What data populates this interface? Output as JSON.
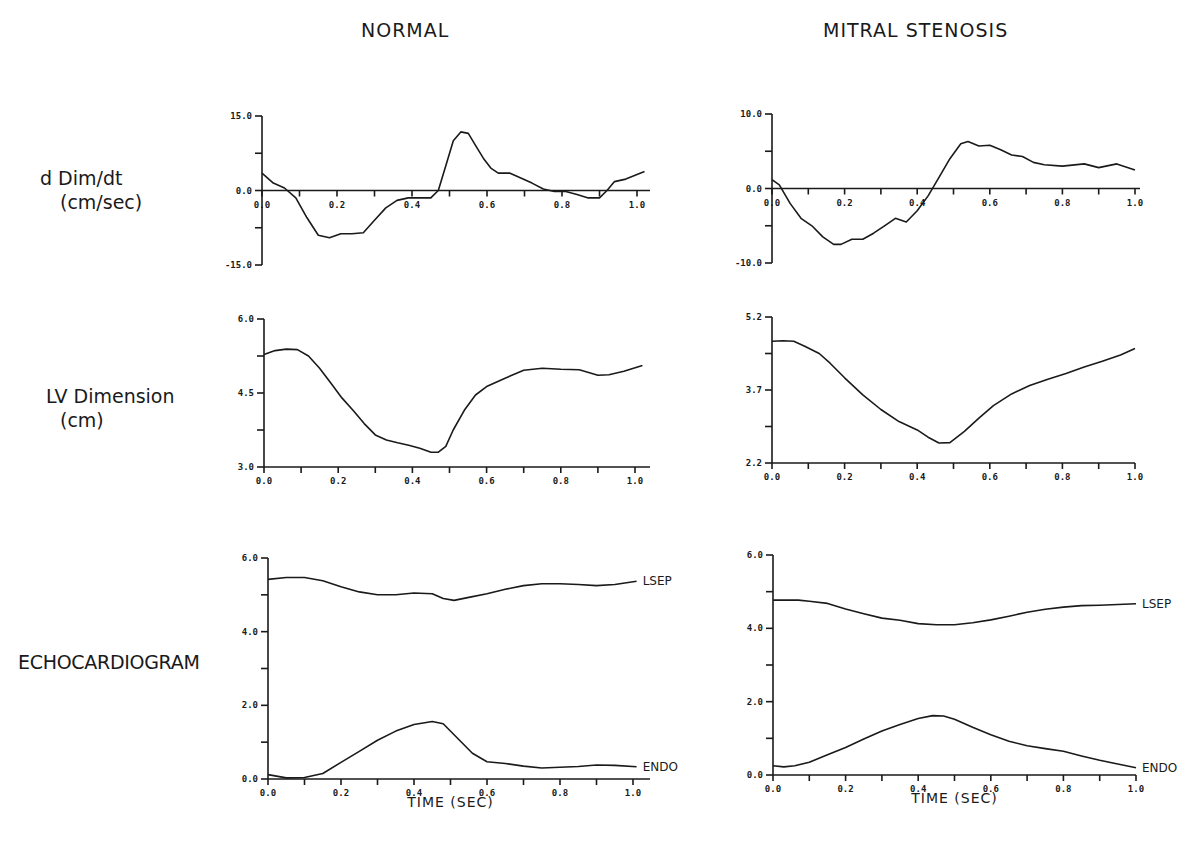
{
  "titles": {
    "left": "NORMAL",
    "right": "MITRAL STENOSIS"
  },
  "row_labels": {
    "ddim_line1": "d Dim/dt",
    "ddim_line2": "(cm/sec)",
    "lv_line1": "LV Dimension",
    "lv_line2": "(cm)",
    "echo": "ECHOCARDIOGRAM"
  },
  "chart_data": [
    {
      "id": "normal-ddim",
      "type": "line",
      "title": "NORMAL",
      "ylabel": "d Dim/dt (cm/sec)",
      "xlabel": "",
      "xlim": [
        0.0,
        1.0
      ],
      "ylim": [
        -15.0,
        15.0
      ],
      "x_ticks": [
        "0.0",
        "0.2",
        "0.4",
        "0.6",
        "0.8",
        "1.0"
      ],
      "y_ticks": [
        "15.0",
        "0.0",
        "-15.0"
      ],
      "zero_line": true,
      "series": [
        {
          "name": "dDim/dt",
          "x": [
            0.0,
            0.03,
            0.06,
            0.09,
            0.12,
            0.15,
            0.18,
            0.21,
            0.24,
            0.27,
            0.3,
            0.33,
            0.36,
            0.39,
            0.42,
            0.45,
            0.47,
            0.49,
            0.51,
            0.53,
            0.55,
            0.57,
            0.59,
            0.61,
            0.63,
            0.66,
            0.69,
            0.72,
            0.75,
            0.78,
            0.81,
            0.84,
            0.87,
            0.9,
            0.92,
            0.94,
            0.97,
            1.02
          ],
          "y": [
            3.5,
            1.5,
            0.5,
            -1.5,
            -5.5,
            -9.0,
            -9.5,
            -8.7,
            -8.7,
            -8.5,
            -6.0,
            -3.5,
            -2.0,
            -1.5,
            -1.5,
            -1.5,
            0.0,
            5.0,
            10.0,
            11.8,
            11.5,
            9.0,
            6.5,
            4.5,
            3.5,
            3.5,
            2.5,
            1.5,
            0.3,
            -0.2,
            -0.2,
            -0.8,
            -1.5,
            -1.5,
            0.0,
            1.8,
            2.3,
            3.8
          ]
        }
      ]
    },
    {
      "id": "ms-ddim",
      "type": "line",
      "title": "MITRAL STENOSIS",
      "ylabel": "d Dim/dt (cm/sec)",
      "xlabel": "",
      "xlim": [
        0.0,
        1.0
      ],
      "ylim": [
        -10.0,
        10.0
      ],
      "x_ticks": [
        "0.0",
        "0.2",
        "0.4",
        "0.6",
        "0.8",
        "1.0"
      ],
      "y_ticks": [
        "10.0",
        "0.0",
        "-10.0"
      ],
      "zero_line": true,
      "series": [
        {
          "name": "dDim/dt",
          "x": [
            0.0,
            0.02,
            0.05,
            0.08,
            0.11,
            0.14,
            0.17,
            0.19,
            0.22,
            0.25,
            0.28,
            0.31,
            0.34,
            0.37,
            0.4,
            0.43,
            0.46,
            0.49,
            0.52,
            0.54,
            0.57,
            0.6,
            0.63,
            0.66,
            0.69,
            0.72,
            0.75,
            0.8,
            0.86,
            0.9,
            0.95,
            1.0
          ],
          "y": [
            1.2,
            0.5,
            -2.0,
            -4.0,
            -5.0,
            -6.5,
            -7.5,
            -7.5,
            -6.8,
            -6.8,
            -6.0,
            -5.0,
            -4.0,
            -4.5,
            -3.0,
            -1.0,
            1.5,
            4.0,
            6.0,
            6.3,
            5.7,
            5.8,
            5.2,
            4.5,
            4.3,
            3.5,
            3.2,
            3.0,
            3.3,
            2.8,
            3.3,
            2.5
          ]
        }
      ]
    },
    {
      "id": "normal-lv",
      "type": "line",
      "title": "NORMAL",
      "ylabel": "LV Dimension (cm)",
      "xlabel": "",
      "xlim": [
        0.0,
        1.0
      ],
      "ylim": [
        3.0,
        6.0
      ],
      "x_ticks": [
        "0.0",
        "0.2",
        "0.4",
        "0.6",
        "0.8",
        "1.0"
      ],
      "y_ticks": [
        "6.0",
        "4.5",
        "3.0"
      ],
      "zero_line": false,
      "series": [
        {
          "name": "LV Dimension",
          "x": [
            0.0,
            0.03,
            0.06,
            0.09,
            0.12,
            0.15,
            0.18,
            0.21,
            0.24,
            0.27,
            0.3,
            0.33,
            0.36,
            0.39,
            0.42,
            0.45,
            0.47,
            0.49,
            0.51,
            0.54,
            0.57,
            0.6,
            0.65,
            0.7,
            0.75,
            0.8,
            0.85,
            0.9,
            0.93,
            0.97,
            1.02
          ],
          "y": [
            5.28,
            5.36,
            5.39,
            5.38,
            5.25,
            5.0,
            4.7,
            4.4,
            4.15,
            3.88,
            3.65,
            3.55,
            3.49,
            3.44,
            3.38,
            3.3,
            3.3,
            3.42,
            3.75,
            4.15,
            4.46,
            4.63,
            4.8,
            4.96,
            5.0,
            4.98,
            4.97,
            4.86,
            4.87,
            4.94,
            5.06
          ]
        }
      ]
    },
    {
      "id": "ms-lv",
      "type": "line",
      "title": "MITRAL STENOSIS",
      "ylabel": "LV Dimension (cm)",
      "xlabel": "",
      "xlim": [
        0.0,
        1.0
      ],
      "ylim": [
        2.2,
        5.2
      ],
      "x_ticks": [
        "0.0",
        "0.2",
        "0.4",
        "0.6",
        "0.8",
        "1.0"
      ],
      "y_ticks": [
        "5.2",
        "3.7",
        "2.2"
      ],
      "zero_line": false,
      "series": [
        {
          "name": "LV Dimension",
          "x": [
            0.0,
            0.03,
            0.06,
            0.09,
            0.13,
            0.16,
            0.2,
            0.25,
            0.3,
            0.35,
            0.4,
            0.43,
            0.46,
            0.49,
            0.53,
            0.57,
            0.61,
            0.66,
            0.71,
            0.76,
            0.81,
            0.86,
            0.91,
            0.96,
            1.0
          ],
          "y": [
            4.7,
            4.71,
            4.7,
            4.6,
            4.45,
            4.25,
            3.95,
            3.6,
            3.3,
            3.05,
            2.88,
            2.73,
            2.61,
            2.62,
            2.85,
            3.12,
            3.38,
            3.62,
            3.79,
            3.92,
            4.04,
            4.17,
            4.29,
            4.42,
            4.55
          ]
        }
      ]
    },
    {
      "id": "normal-echo",
      "type": "line",
      "title": "NORMAL",
      "ylabel": "ECHOCARDIOGRAM",
      "xlabel": "TIME (SEC)",
      "xlim": [
        0.0,
        1.0
      ],
      "ylim": [
        0.0,
        6.0
      ],
      "x_ticks": [
        "0.0",
        "0.2",
        "0.4",
        "0.6",
        "0.8",
        "1.0"
      ],
      "y_ticks": [
        "6.0",
        "4.0",
        "2.0",
        "0.0"
      ],
      "zero_line": false,
      "series": [
        {
          "name": "LSEP",
          "x": [
            0.0,
            0.05,
            0.1,
            0.15,
            0.2,
            0.25,
            0.3,
            0.35,
            0.4,
            0.45,
            0.48,
            0.51,
            0.55,
            0.6,
            0.65,
            0.7,
            0.75,
            0.8,
            0.85,
            0.9,
            0.95,
            1.01
          ],
          "y": [
            5.42,
            5.47,
            5.47,
            5.38,
            5.22,
            5.08,
            5.0,
            5.0,
            5.05,
            5.03,
            4.9,
            4.85,
            4.93,
            5.03,
            5.15,
            5.25,
            5.3,
            5.3,
            5.28,
            5.25,
            5.28,
            5.37
          ]
        },
        {
          "name": "ENDO",
          "x": [
            0.0,
            0.05,
            0.1,
            0.15,
            0.2,
            0.25,
            0.3,
            0.35,
            0.4,
            0.45,
            0.48,
            0.52,
            0.56,
            0.6,
            0.65,
            0.7,
            0.75,
            0.8,
            0.85,
            0.9,
            0.95,
            1.01
          ],
          "y": [
            0.12,
            0.03,
            0.04,
            0.15,
            0.45,
            0.75,
            1.05,
            1.3,
            1.48,
            1.56,
            1.5,
            1.1,
            0.7,
            0.47,
            0.42,
            0.35,
            0.3,
            0.32,
            0.34,
            0.38,
            0.37,
            0.33
          ]
        }
      ]
    },
    {
      "id": "ms-echo",
      "type": "line",
      "title": "MITRAL STENOSIS",
      "ylabel": "ECHOCARDIOGRAM",
      "xlabel": "TIME (SEC)",
      "xlim": [
        0.0,
        1.0
      ],
      "ylim": [
        0.0,
        6.0
      ],
      "x_ticks": [
        "0.0",
        "0.2",
        "0.4",
        "0.6",
        "0.8",
        "1.0"
      ],
      "y_ticks": [
        "6.0",
        "4.0",
        "2.0",
        "0.0"
      ],
      "zero_line": false,
      "series": [
        {
          "name": "LSEP",
          "x": [
            0.0,
            0.03,
            0.07,
            0.1,
            0.15,
            0.2,
            0.25,
            0.3,
            0.35,
            0.4,
            0.45,
            0.5,
            0.55,
            0.6,
            0.65,
            0.7,
            0.75,
            0.8,
            0.85,
            0.9,
            0.95,
            1.0
          ],
          "y": [
            4.77,
            4.77,
            4.77,
            4.74,
            4.68,
            4.53,
            4.4,
            4.28,
            4.22,
            4.13,
            4.1,
            4.1,
            4.15,
            4.23,
            4.33,
            4.44,
            4.52,
            4.58,
            4.62,
            4.63,
            4.65,
            4.67
          ]
        },
        {
          "name": "ENDO",
          "x": [
            0.0,
            0.03,
            0.06,
            0.1,
            0.15,
            0.2,
            0.25,
            0.3,
            0.35,
            0.4,
            0.44,
            0.47,
            0.5,
            0.55,
            0.6,
            0.65,
            0.7,
            0.75,
            0.8,
            0.85,
            0.9,
            0.95,
            1.0
          ],
          "y": [
            0.25,
            0.22,
            0.25,
            0.35,
            0.55,
            0.75,
            0.98,
            1.2,
            1.38,
            1.54,
            1.62,
            1.61,
            1.52,
            1.3,
            1.1,
            0.92,
            0.8,
            0.72,
            0.65,
            0.52,
            0.4,
            0.3,
            0.2
          ]
        }
      ]
    }
  ],
  "series_labels": {
    "lsep": "LSEP",
    "endo": "ENDO"
  }
}
